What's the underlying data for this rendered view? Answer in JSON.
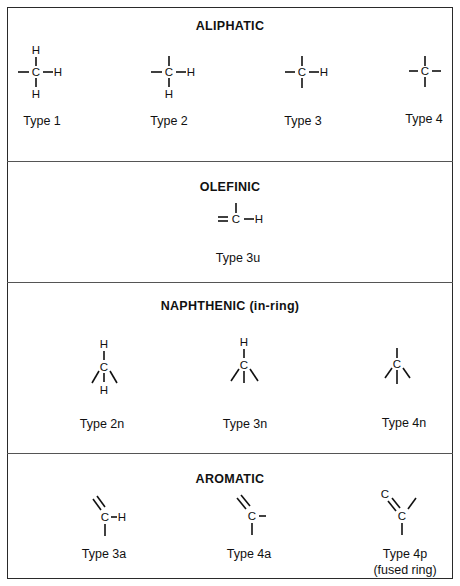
{
  "sections": {
    "aliphatic": {
      "title": "ALIPHATIC",
      "types": [
        {
          "label": "Type 1",
          "atoms": "C with H above, H right, H below, bond left"
        },
        {
          "label": "Type 2",
          "atoms": "C with bond above, H right, H below, bond left"
        },
        {
          "label": "Type 3",
          "atoms": "C with bond above, H right, bond below, bond left"
        },
        {
          "label": "Type 4",
          "atoms": "C with four single bonds"
        }
      ]
    },
    "olefinic": {
      "title": "OLEFINIC",
      "types": [
        {
          "label": "Type 3u",
          "atoms": "C with double bond left, bond above, H right"
        }
      ]
    },
    "naphthenic": {
      "title": "NAPHTHENIC (in-ring)",
      "types": [
        {
          "label": "Type 2n",
          "atoms": "ring C with H above and H below"
        },
        {
          "label": "Type 3n",
          "atoms": "ring C with H above and bond below"
        },
        {
          "label": "Type 4n",
          "atoms": "ring C with bond above and bond below"
        }
      ]
    },
    "aromatic": {
      "title": "AROMATIC",
      "types": [
        {
          "label": "Type 3a",
          "atoms": "aromatic C with double bond, H right, bond below"
        },
        {
          "label": "Type 4a",
          "atoms": "aromatic C with double bond, bond right, bond below"
        },
        {
          "label": "Type 4p",
          "sublabel": "(fused ring)",
          "atoms": "C double bonded to C, bond right, bond below"
        }
      ]
    }
  },
  "atoms": {
    "carbon": "C",
    "hydrogen": "H"
  }
}
